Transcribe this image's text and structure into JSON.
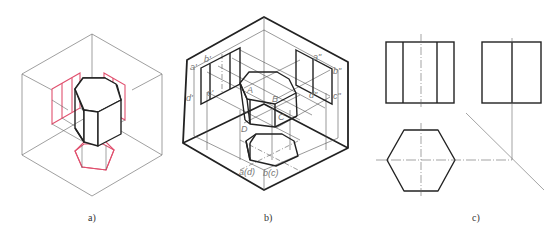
{
  "figure": {
    "panels": [
      {
        "id": "a",
        "caption": "a)",
        "description": "Isometric view of hexagonal prism with projections onto three planes (red)"
      },
      {
        "id": "b",
        "caption": "b)",
        "description": "Isometric view of projection box with labeled vertices"
      },
      {
        "id": "c",
        "caption": "c)",
        "description": "Three orthographic views: front, side, top"
      }
    ],
    "labels_b": {
      "a_prime": "a'",
      "b_prime": "b'",
      "c_prime": "c'",
      "d_prime": "d'",
      "a_dprime": "a\"",
      "b_dprime": "b\"",
      "c_dprime": "c\"",
      "d_dprime": "d\"",
      "A": "A",
      "B": "B",
      "C": "C",
      "D": "D",
      "ad": "a(d)",
      "bc": "b(c)"
    },
    "colors": {
      "edge": "#222222",
      "thin": "#666666",
      "projection": "#e0506e"
    }
  }
}
